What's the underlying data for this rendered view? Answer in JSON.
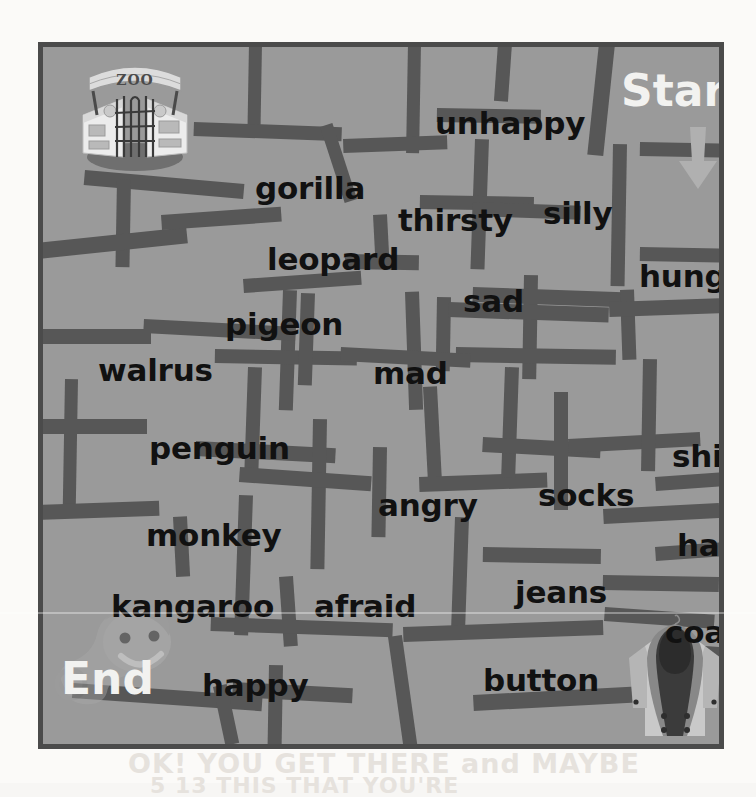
{
  "page": {
    "background_color": "#fbfaf8",
    "maze_background_color": "#9a9a9a",
    "maze_border_color": "#4b4b4b",
    "wall_color": "#575757",
    "word_color": "#111111",
    "label_color": "#f2f2f0"
  },
  "labels": {
    "start": "Start",
    "end": "End",
    "start_arrow_icon": "down-arrow-icon",
    "zoo_sign_text": "ZOO"
  },
  "illustrations": {
    "zoo_gate": "zoo-gate-illustration",
    "coat": "coat-illustration",
    "worm": "worm-character-illustration"
  },
  "showthrough": {
    "line1": "OK! YOU GET THERE and MAYBE",
    "line2": "5 13 THIS THAT YOU'RE"
  },
  "words": [
    {
      "text": "unhappy",
      "x": 392,
      "y": 58,
      "size": 31,
      "category": "feeling"
    },
    {
      "text": "gorilla",
      "x": 212,
      "y": 123,
      "size": 31,
      "category": "zoo-animal"
    },
    {
      "text": "thirsty",
      "x": 355,
      "y": 155,
      "size": 31,
      "category": "feeling"
    },
    {
      "text": "silly",
      "x": 500,
      "y": 148,
      "size": 31,
      "category": "feeling"
    },
    {
      "text": "leopard",
      "x": 224,
      "y": 194,
      "size": 31,
      "category": "zoo-animal"
    },
    {
      "text": "sad",
      "x": 420,
      "y": 236,
      "size": 31,
      "category": "feeling"
    },
    {
      "text": "hungry",
      "x": 596,
      "y": 211,
      "size": 31,
      "category": "feeling"
    },
    {
      "text": "pigeon",
      "x": 182,
      "y": 259,
      "size": 31,
      "category": "zoo-animal"
    },
    {
      "text": "walrus",
      "x": 55,
      "y": 305,
      "size": 31,
      "category": "zoo-animal"
    },
    {
      "text": "mad",
      "x": 330,
      "y": 308,
      "size": 31,
      "category": "feeling"
    },
    {
      "text": "penguin",
      "x": 106,
      "y": 383,
      "size": 31,
      "category": "zoo-animal"
    },
    {
      "text": "shirt",
      "x": 629,
      "y": 391,
      "size": 31,
      "category": "clothing"
    },
    {
      "text": "socks",
      "x": 495,
      "y": 430,
      "size": 31,
      "category": "clothing"
    },
    {
      "text": "angry",
      "x": 335,
      "y": 440,
      "size": 31,
      "category": "feeling"
    },
    {
      "text": "monkey",
      "x": 103,
      "y": 470,
      "size": 31,
      "category": "zoo-animal"
    },
    {
      "text": "hat",
      "x": 634,
      "y": 480,
      "size": 31,
      "category": "clothing"
    },
    {
      "text": "jeans",
      "x": 472,
      "y": 527,
      "size": 31,
      "category": "clothing"
    },
    {
      "text": "kangaroo",
      "x": 68,
      "y": 541,
      "size": 31,
      "category": "zoo-animal"
    },
    {
      "text": "afraid",
      "x": 271,
      "y": 541,
      "size": 31,
      "category": "feeling"
    },
    {
      "text": "coat",
      "x": 622,
      "y": 567,
      "size": 31,
      "category": "clothing"
    },
    {
      "text": "happy",
      "x": 159,
      "y": 620,
      "size": 31,
      "category": "feeling"
    },
    {
      "text": "button",
      "x": 440,
      "y": 615,
      "size": 31,
      "category": "clothing"
    }
  ],
  "walls": [
    {
      "x": 206,
      "y": -4,
      "w": 13,
      "h": 92,
      "r": 1
    },
    {
      "x": 151,
      "y": 75,
      "w": 148,
      "h": 14,
      "r": 2
    },
    {
      "x": 277,
      "y": 80,
      "w": 13,
      "h": 80,
      "r": -18
    },
    {
      "x": 365,
      "y": -4,
      "w": 13,
      "h": 110,
      "r": 1
    },
    {
      "x": 455,
      "y": -4,
      "w": 14,
      "h": 58,
      "r": 4
    },
    {
      "x": 556,
      "y": -4,
      "w": 16,
      "h": 112,
      "r": 6
    },
    {
      "x": 394,
      "y": 61,
      "w": 104,
      "h": 14,
      "r": 1
    },
    {
      "x": 300,
      "y": 92,
      "w": 104,
      "h": 14,
      "r": 358
    },
    {
      "x": 432,
      "y": 92,
      "w": 14,
      "h": 130,
      "r": 2
    },
    {
      "x": 570,
      "y": 97,
      "w": 14,
      "h": 142,
      "r": 1
    },
    {
      "x": 597,
      "y": 95,
      "w": 80,
      "h": 14,
      "r": 1
    },
    {
      "x": 597,
      "y": 200,
      "w": 80,
      "h": 14,
      "r": 1
    },
    {
      "x": 377,
      "y": 148,
      "w": 114,
      "h": 14,
      "r": 1
    },
    {
      "x": 42,
      "y": 123,
      "w": 160,
      "h": 15,
      "r": 5
    },
    {
      "x": 74,
      "y": 132,
      "w": 14,
      "h": 88,
      "r": 1
    },
    {
      "x": -6,
      "y": 196,
      "w": 150,
      "h": 16,
      "r": -6
    },
    {
      "x": 118,
      "y": 168,
      "w": 120,
      "h": 15,
      "r": 356
    },
    {
      "x": 330,
      "y": 168,
      "w": 14,
      "h": 54,
      "r": -3
    },
    {
      "x": 302,
      "y": 207,
      "w": 74,
      "h": 15,
      "r": 1
    },
    {
      "x": 200,
      "y": 232,
      "w": 118,
      "h": 14,
      "r": 356
    },
    {
      "x": 240,
      "y": 243,
      "w": 14,
      "h": 120,
      "r": 2
    },
    {
      "x": 430,
      "y": 155,
      "w": 108,
      "h": 14,
      "r": 2
    },
    {
      "x": 481,
      "y": 228,
      "w": 14,
      "h": 104,
      "r": 1
    },
    {
      "x": 430,
      "y": 240,
      "w": 150,
      "h": 15,
      "r": 2
    },
    {
      "x": 577,
      "y": 243,
      "w": 14,
      "h": 70,
      "r": -2
    },
    {
      "x": 101,
      "y": 272,
      "w": 152,
      "h": 14,
      "r": 3
    },
    {
      "x": -4,
      "y": 282,
      "w": 112,
      "h": 15,
      "r": 0
    },
    {
      "x": 172,
      "y": 302,
      "w": 142,
      "h": 14,
      "r": 1
    },
    {
      "x": 258,
      "y": 246,
      "w": 14,
      "h": 92,
      "r": 2
    },
    {
      "x": 362,
      "y": 245,
      "w": 14,
      "h": 118,
      "r": -2
    },
    {
      "x": 394,
      "y": 250,
      "w": 14,
      "h": 74,
      "r": 1
    },
    {
      "x": 406,
      "y": 255,
      "w": 160,
      "h": 15,
      "r": 2
    },
    {
      "x": 413,
      "y": 300,
      "w": 160,
      "h": 15,
      "r": 1
    },
    {
      "x": 566,
      "y": 255,
      "w": 110,
      "h": 15,
      "r": -2
    },
    {
      "x": 298,
      "y": 300,
      "w": 130,
      "h": 14,
      "r": 3
    },
    {
      "x": 22,
      "y": 332,
      "w": 13,
      "h": 128,
      "r": 1
    },
    {
      "x": -6,
      "y": 372,
      "w": 110,
      "h": 15,
      "r": 0
    },
    {
      "x": -6,
      "y": 458,
      "w": 122,
      "h": 15,
      "r": -2
    },
    {
      "x": 205,
      "y": 320,
      "w": 14,
      "h": 108,
      "r": 2
    },
    {
      "x": 153,
      "y": 394,
      "w": 140,
      "h": 15,
      "r": 3
    },
    {
      "x": 270,
      "y": 372,
      "w": 14,
      "h": 150,
      "r": 1
    },
    {
      "x": 197,
      "y": 420,
      "w": 132,
      "h": 15,
      "r": 4
    },
    {
      "x": 380,
      "y": 340,
      "w": 14,
      "h": 100,
      "r": -3
    },
    {
      "x": 330,
      "y": 400,
      "w": 14,
      "h": 90,
      "r": 1
    },
    {
      "x": 376,
      "y": 430,
      "w": 128,
      "h": 15,
      "r": -2
    },
    {
      "x": 462,
      "y": 320,
      "w": 14,
      "h": 110,
      "r": 2
    },
    {
      "x": 440,
      "y": 390,
      "w": 118,
      "h": 15,
      "r": 3
    },
    {
      "x": 511,
      "y": 345,
      "w": 14,
      "h": 118,
      "r": 0
    },
    {
      "x": 525,
      "y": 392,
      "w": 132,
      "h": 14,
      "r": -3
    },
    {
      "x": 600,
      "y": 312,
      "w": 14,
      "h": 112,
      "r": 1
    },
    {
      "x": 560,
      "y": 462,
      "w": 116,
      "h": 15,
      "r": -3
    },
    {
      "x": 412,
      "y": 470,
      "w": 14,
      "h": 110,
      "r": 2
    },
    {
      "x": 440,
      "y": 500,
      "w": 118,
      "h": 15,
      "r": 1
    },
    {
      "x": 560,
      "y": 528,
      "w": 116,
      "h": 15,
      "r": 1
    },
    {
      "x": 196,
      "y": 448,
      "w": 14,
      "h": 140,
      "r": 2
    },
    {
      "x": 130,
      "y": 470,
      "w": 14,
      "h": 60,
      "r": -3
    },
    {
      "x": 236,
      "y": 530,
      "w": 14,
      "h": 70,
      "r": -4
    },
    {
      "x": 168,
      "y": 570,
      "w": 182,
      "h": 14,
      "r": 2
    },
    {
      "x": 360,
      "y": 580,
      "w": 200,
      "h": 15,
      "r": -2
    },
    {
      "x": 345,
      "y": 590,
      "w": 14,
      "h": 110,
      "r": -8
    },
    {
      "x": 30,
      "y": 636,
      "w": 190,
      "h": 15,
      "r": 4
    },
    {
      "x": 170,
      "y": 640,
      "w": 14,
      "h": 60,
      "r": -12
    },
    {
      "x": 190,
      "y": 635,
      "w": 120,
      "h": 15,
      "r": 3
    },
    {
      "x": 226,
      "y": 618,
      "w": 14,
      "h": 80,
      "r": 1
    },
    {
      "x": 430,
      "y": 648,
      "w": 196,
      "h": 16,
      "r": -3
    },
    {
      "x": 620,
      "y": 596,
      "w": 60,
      "h": 15,
      "r": 4
    },
    {
      "x": 562,
      "y": 560,
      "w": 110,
      "h": 14,
      "r": 4
    },
    {
      "x": 612,
      "y": 430,
      "w": 70,
      "h": 14,
      "r": -4
    },
    {
      "x": 612,
      "y": 500,
      "w": 70,
      "h": 14,
      "r": -4
    }
  ]
}
